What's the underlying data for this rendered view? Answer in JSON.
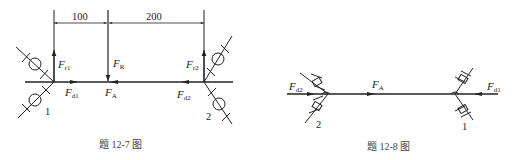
{
  "figures": [
    {
      "id": "fig-12-7",
      "caption": "题 12-7 图",
      "dimensions": {
        "left": "100",
        "right": "200"
      },
      "labels": {
        "Fr1": {
          "main": "F",
          "sub": "r1"
        },
        "FR": {
          "main": "F",
          "sub": "R"
        },
        "Fr2": {
          "main": "F",
          "sub": "r2"
        },
        "Fd1": {
          "main": "F",
          "sub": "d1"
        },
        "FA": {
          "main": "F",
          "sub": "A"
        },
        "Fd2": {
          "main": "F",
          "sub": "d2"
        }
      },
      "bearings": {
        "left": "1",
        "right": "2"
      }
    },
    {
      "id": "fig-12-8",
      "caption": "题 12-8 图",
      "labels": {
        "Fd2": {
          "main": "F",
          "sub": "d2"
        },
        "FA": {
          "main": "F",
          "sub": "A"
        },
        "Fd1": {
          "main": "F",
          "sub": "d1"
        }
      },
      "bearings": {
        "left": "2",
        "right": "1"
      }
    }
  ]
}
